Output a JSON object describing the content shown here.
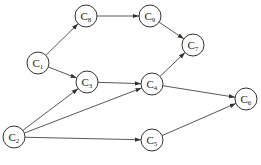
{
  "diagram": {
    "type": "directed-graph",
    "nodes": [
      {
        "id": "C1",
        "letter": "C",
        "sub": "1"
      },
      {
        "id": "C2",
        "letter": "C",
        "sub": "2"
      },
      {
        "id": "C3",
        "letter": "C",
        "sub": "3"
      },
      {
        "id": "C4",
        "letter": "C",
        "sub": "4"
      },
      {
        "id": "C5",
        "letter": "C",
        "sub": "5"
      },
      {
        "id": "C6",
        "letter": "C",
        "sub": "6"
      },
      {
        "id": "C7",
        "letter": "C",
        "sub": "7"
      },
      {
        "id": "C8",
        "letter": "C",
        "sub": "8"
      },
      {
        "id": "C9",
        "letter": "C",
        "sub": "9"
      }
    ],
    "edges": [
      {
        "from": "C1",
        "to": "C8"
      },
      {
        "from": "C1",
        "to": "C3"
      },
      {
        "from": "C8",
        "to": "C9"
      },
      {
        "from": "C9",
        "to": "C7"
      },
      {
        "from": "C3",
        "to": "C4"
      },
      {
        "from": "C4",
        "to": "C7"
      },
      {
        "from": "C4",
        "to": "C6"
      },
      {
        "from": "C5",
        "to": "C6"
      },
      {
        "from": "C2",
        "to": "C3"
      },
      {
        "from": "C2",
        "to": "C4"
      },
      {
        "from": "C2",
        "to": "C5"
      }
    ],
    "colors": {
      "stroke": "#333333",
      "background": "#ffffff"
    }
  }
}
